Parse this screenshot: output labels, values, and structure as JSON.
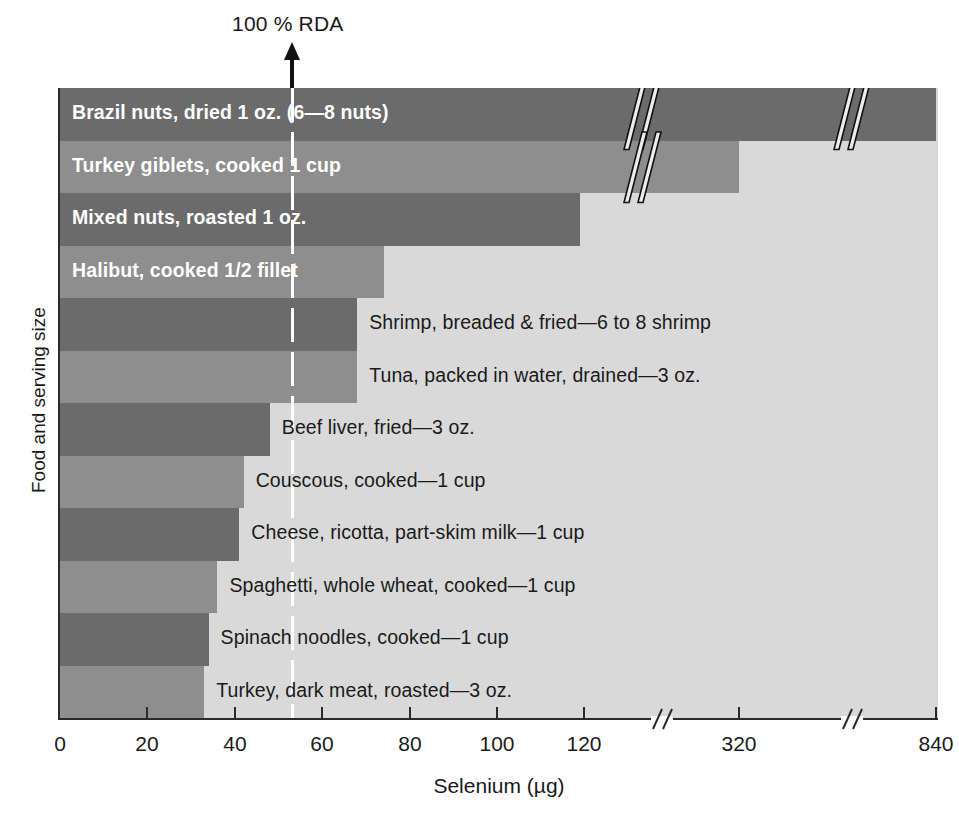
{
  "chart_data": {
    "type": "bar",
    "orientation": "horizontal",
    "title": "",
    "xlabel": "Selenium (µg)",
    "ylabel": "Food and serving size",
    "xlim": [
      0,
      840
    ],
    "grid": false,
    "legend": null,
    "axis_breaks": [
      "between 120 and 320",
      "between 320 and 840"
    ],
    "tick_labels": [
      "0",
      "20",
      "40",
      "60",
      "80",
      "100",
      "120",
      "320",
      "840"
    ],
    "tick_values": [
      0,
      20,
      40,
      60,
      80,
      100,
      120,
      320,
      840
    ],
    "annotation": {
      "text": "100 % RDA",
      "value": 53,
      "marker": "white dashed vertical line with arrow"
    },
    "categories": [
      "Brazil nuts, dried 1 oz. (6—8 nuts)",
      "Turkey giblets, cooked 1 cup",
      "Mixed nuts, roasted 1 oz.",
      "Halibut, cooked 1/2 fillet",
      "Shrimp, breaded & fried—6 to 8 shrimp",
      "Tuna, packed in water, drained—3 oz.",
      "Beef liver, fried—3 oz.",
      "Couscous, cooked—1 cup",
      "Cheese, ricotta, part-skim milk—1 cup",
      "Spaghetti, whole wheat, cooked—1 cup",
      "Spinach noodles, cooked—1 cup",
      "Turkey, dark meat, roasted—3 oz."
    ],
    "values": [
      840,
      320,
      119,
      74,
      68,
      68,
      48,
      42,
      41,
      36,
      34,
      33
    ]
  },
  "bars": [
    {
      "label": "Brazil nuts, dried 1 oz. (6—8 nuts)",
      "value": 840,
      "shade": "dark",
      "label_inside": true,
      "break_at": [
        620,
        830
      ]
    },
    {
      "label": "Turkey giblets, cooked 1 cup",
      "value": 320,
      "shade": "light",
      "label_inside": true,
      "break_at": [
        620
      ]
    },
    {
      "label": "Mixed nuts, roasted 1 oz.",
      "value": 119,
      "shade": "dark",
      "label_inside": true,
      "break_at": []
    },
    {
      "label": "Halibut, cooked 1/2 fillet",
      "value": 74,
      "shade": "light",
      "label_inside": true,
      "break_at": []
    },
    {
      "label": "Shrimp, breaded & fried—6 to 8 shrimp",
      "value": 68,
      "shade": "dark",
      "label_inside": false,
      "break_at": []
    },
    {
      "label": "Tuna, packed in water, drained—3 oz.",
      "value": 68,
      "shade": "light",
      "label_inside": false,
      "break_at": []
    },
    {
      "label": "Beef liver, fried—3 oz.",
      "value": 48,
      "shade": "dark",
      "label_inside": false,
      "break_at": []
    },
    {
      "label": "Couscous, cooked—1 cup",
      "value": 42,
      "shade": "light",
      "label_inside": false,
      "break_at": []
    },
    {
      "label": "Cheese, ricotta, part-skim milk—1 cup",
      "value": 41,
      "shade": "dark",
      "label_inside": false,
      "break_at": []
    },
    {
      "label": "Spaghetti, whole wheat, cooked—1 cup",
      "value": 36,
      "shade": "light",
      "label_inside": false,
      "break_at": []
    },
    {
      "label": "Spinach noodles, cooked—1 cup",
      "value": 34,
      "shade": "dark",
      "label_inside": false,
      "break_at": []
    },
    {
      "label": "Turkey, dark meat, roasted—3 oz.",
      "value": 33,
      "shade": "light",
      "label_inside": false,
      "break_at": []
    }
  ],
  "axis": {
    "x_title": "Selenium (µg)",
    "y_title": "Food and serving size",
    "ticks": [
      {
        "label": "0",
        "x": 60
      },
      {
        "label": "20",
        "x": 147
      },
      {
        "label": "40",
        "x": 235
      },
      {
        "label": "60",
        "x": 322
      },
      {
        "label": "80",
        "x": 410
      },
      {
        "label": "100",
        "x": 497
      },
      {
        "label": "120",
        "x": 584
      },
      {
        "label": "320",
        "x": 739
      },
      {
        "label": "840",
        "x": 936
      }
    ],
    "break_x": [
      663,
      853
    ]
  },
  "annotation": {
    "rda_text": "100 % RDA",
    "rda_x": 292
  },
  "colors": {
    "bar_dark": "#6b6b6b",
    "bar_light": "#8e8e8e",
    "plot_background": "#d9d9d9",
    "rda_line": "#ffffff",
    "axis": "#2a2a2a",
    "text": "#1a1a1a",
    "inside_label": "#ffffff"
  }
}
